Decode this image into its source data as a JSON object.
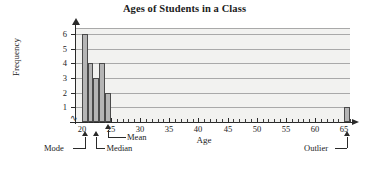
{
  "chart_data": {
    "type": "bar",
    "title": "Ages of Students in a Class",
    "xlabel": "Age",
    "ylabel": "Frequency",
    "xlim": [
      19,
      66
    ],
    "ylim": [
      0,
      6.4
    ],
    "grid": true,
    "legend": "none",
    "categories": [
      20,
      21,
      22,
      23,
      24,
      65
    ],
    "values": [
      6,
      4,
      3,
      4,
      2,
      1
    ],
    "x_tick_labels": [
      "20",
      "25",
      "30",
      "35",
      "40",
      "45",
      "50",
      "55",
      "60",
      "65"
    ],
    "x_tick_values": [
      20,
      25,
      30,
      35,
      40,
      45,
      50,
      55,
      60,
      65
    ],
    "x_minor_tick_step": 1,
    "y_tick_labels": [
      "1",
      "2",
      "3",
      "4",
      "5",
      "6"
    ],
    "y_tick_values": [
      1,
      2,
      3,
      4,
      5,
      6
    ],
    "bar_fill_color": "#b5b5b5",
    "bar_edge_color": "#4a4a4a",
    "plot_background_color": "#f2f2f0",
    "gridline_color": "#a9a9a9",
    "annotations": [
      {
        "label": "Mode",
        "x_value": 20
      },
      {
        "label": "Median",
        "x_value": 22
      },
      {
        "label": "Mean",
        "x_value": 24
      },
      {
        "label": "Outlier",
        "x_value": 65
      }
    ]
  }
}
